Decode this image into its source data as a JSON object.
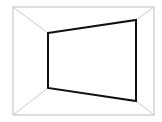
{
  "diagram": {
    "type": "perspective-room-wireframe",
    "outer_rect": {
      "x1": 13,
      "y1": 7,
      "x2": 154,
      "y2": 115,
      "stroke": "#c8c8c8",
      "width": 1.2
    },
    "inner_quad": {
      "points": [
        [
          48,
          33
        ],
        [
          136,
          20
        ],
        [
          136,
          101
        ],
        [
          48,
          88
        ]
      ],
      "stroke": "#111111",
      "width": 2
    },
    "connectors": {
      "stroke": "#cccccc",
      "width": 1
    },
    "background": "#ffffff"
  }
}
